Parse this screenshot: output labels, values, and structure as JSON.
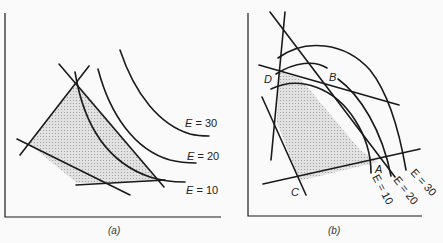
{
  "panels": [
    {
      "id": "a",
      "caption": "(a)",
      "description": "Feasible region (shaded polygon) bounded by four constraint lines, with iso-objective curves E = 10, 20, 30 convex toward origin; optimum at vertex touching E = 10",
      "curve_labels": [
        {
          "var": "E",
          "eq": " = 30"
        },
        {
          "var": "E",
          "eq": " = 20"
        },
        {
          "var": "E",
          "eq": " = 10"
        }
      ]
    },
    {
      "id": "b",
      "caption": "(b)",
      "description": "Feasible region (shaded) bounded by constraint lines with vertices A, B, C, D; concave iso-objective curves E = 10, 20, 30",
      "vertex_labels": [
        "A",
        "B",
        "C",
        "D"
      ],
      "curve_labels": [
        {
          "text": "E = 10"
        },
        {
          "text": "E = 20"
        },
        {
          "text": "E = 30"
        }
      ]
    }
  ],
  "colors": {
    "line": "#1a1a1a",
    "shade": "#d4d4d4",
    "background": "#fafafa"
  }
}
